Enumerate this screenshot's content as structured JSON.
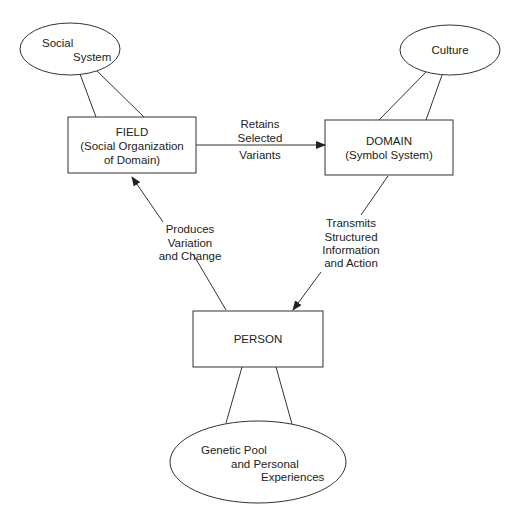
{
  "nodes": {
    "social_system": {
      "line1": "Social",
      "line2": "System"
    },
    "culture": {
      "label": "Culture"
    },
    "field": {
      "title": "FIELD",
      "line2": "(Social Organization",
      "line3": "of Domain)"
    },
    "domain": {
      "title": "DOMAIN",
      "line2": "(Symbol System)"
    },
    "person": {
      "title": "PERSON"
    },
    "genetic": {
      "line1": "Genetic Pool",
      "line2": "and Personal",
      "line3": "Experiences"
    }
  },
  "edges": {
    "field_to_domain": {
      "line1": "Retains",
      "line2": "Selected",
      "line3": "Variants"
    },
    "person_to_field": {
      "line1": "Produces",
      "line2": "Variation",
      "line3": "and Change"
    },
    "domain_to_person": {
      "line1": "Transmits",
      "line2": "Structured",
      "line3": "Information",
      "line4": "and Action"
    }
  },
  "colors": {
    "stroke": "#333333",
    "text": "#222222"
  }
}
